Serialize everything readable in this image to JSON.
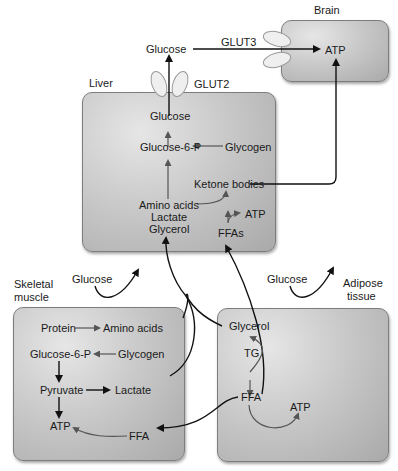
{
  "organs": {
    "brain": {
      "label": "Brain",
      "atp": "ATP"
    },
    "liver": {
      "label": "Liver",
      "glucose": "Glucose",
      "glucose6p": "Glucose-6-P",
      "glycogen": "Glycogen",
      "ketone_bodies": "Ketone bodies",
      "amino_acids": "Amino acids",
      "lactate": "Lactate",
      "glycerol": "Glycerol",
      "atp": "ATP",
      "ffas": "FFAs"
    },
    "skeletal_muscle": {
      "label_line1": "Skeletal",
      "label_line2": "muscle",
      "protein": "Protein",
      "amino_acids": "Amino acids",
      "glucose6p": "Glucose-6-P",
      "glycogen": "Glycogen",
      "pyruvate": "Pyruvate",
      "lactate": "Lactate",
      "atp": "ATP",
      "ffa": "FFA"
    },
    "adipose": {
      "label_line1": "Adipose",
      "label_line2": "tissue",
      "glycerol": "Glycerol",
      "tg": "TG",
      "ffa": "FFA",
      "atp": "ATP"
    }
  },
  "transporters": {
    "glut2": "GLUT2",
    "glut3": "GLUT3"
  },
  "blood": {
    "glucose_out": "Glucose",
    "glucose_muscle": "Glucose",
    "glucose_adipose": "Glucose"
  },
  "colors": {
    "box_light": "#e6e6e6",
    "box_dark": "#a9a9a9",
    "arrow_dark": "#111111",
    "arrow_gray": "#555555",
    "transporter": "#eeeeee"
  }
}
